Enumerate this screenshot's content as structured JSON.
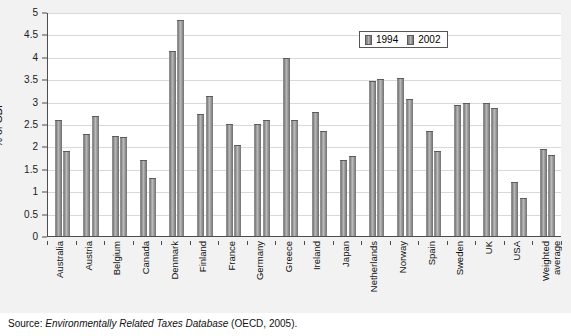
{
  "chart_data": {
    "type": "bar",
    "title": "",
    "xlabel": "",
    "ylabel": "% of GDP",
    "ylim": [
      0,
      5
    ],
    "ytick_step": 0.5,
    "yticks": [
      "0",
      "0.5",
      "1",
      "1.5",
      "2",
      "2.5",
      "3",
      "3.5",
      "4",
      "4.5",
      "5"
    ],
    "grid": true,
    "legend_position": "top-right",
    "categories": [
      "Australia",
      "Austria",
      "Belgium",
      "Canada",
      "Denmark",
      "Finland",
      "France",
      "Germany",
      "Greece",
      "Ireland",
      "Japan",
      "Netherlands",
      "Norway",
      "Spain",
      "Sweden",
      "UK",
      "USA",
      "Weighted average"
    ],
    "series": [
      {
        "name": "1994",
        "color": "#8e8e8e",
        "values": [
          2.6,
          2.28,
          2.23,
          1.7,
          4.12,
          2.72,
          2.5,
          2.5,
          3.97,
          2.77,
          1.7,
          3.45,
          3.52,
          2.35,
          2.93,
          2.98,
          1.2,
          1.95
        ]
      },
      {
        "name": "2002",
        "color": "#929292",
        "values": [
          1.9,
          2.67,
          2.22,
          1.3,
          4.82,
          3.13,
          2.03,
          2.58,
          2.58,
          2.35,
          1.78,
          3.5,
          3.05,
          1.9,
          2.97,
          2.85,
          0.85,
          1.8
        ]
      }
    ]
  },
  "legend": {
    "items": [
      {
        "label": "1994"
      },
      {
        "label": "2002"
      }
    ]
  },
  "source": {
    "prefix": "Source: ",
    "italic_title": "Environmentally Related Taxes Database",
    "suffix": " (OECD, 2005)."
  }
}
